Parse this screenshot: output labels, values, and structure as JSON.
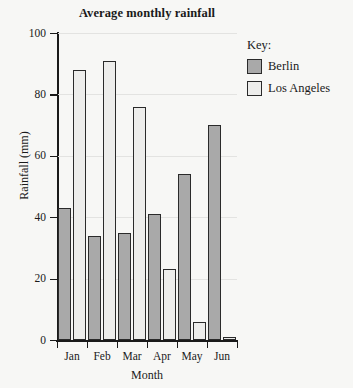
{
  "chart_data": {
    "type": "bar",
    "title": "Average monthly rainfall",
    "xlabel": "Month",
    "ylabel": "Rainfall (mm)",
    "categories": [
      "Jan",
      "Feb",
      "Mar",
      "Apr",
      "May",
      "Jun"
    ],
    "series": [
      {
        "name": "Berlin",
        "values": [
          43,
          34,
          35,
          41,
          54,
          70
        ],
        "color": "#a9a9a9"
      },
      {
        "name": "Los Angeles",
        "values": [
          88,
          91,
          76,
          23,
          6,
          1
        ],
        "color": "#ededeb"
      }
    ],
    "ylim": [
      0,
      100
    ],
    "yticks": [
      0,
      20,
      40,
      60,
      80,
      100
    ],
    "ytick_labels": [
      "0",
      "20",
      "40",
      "60",
      "80",
      "100"
    ],
    "grid": true,
    "legend_position": "right",
    "legend_title": "Key:"
  }
}
